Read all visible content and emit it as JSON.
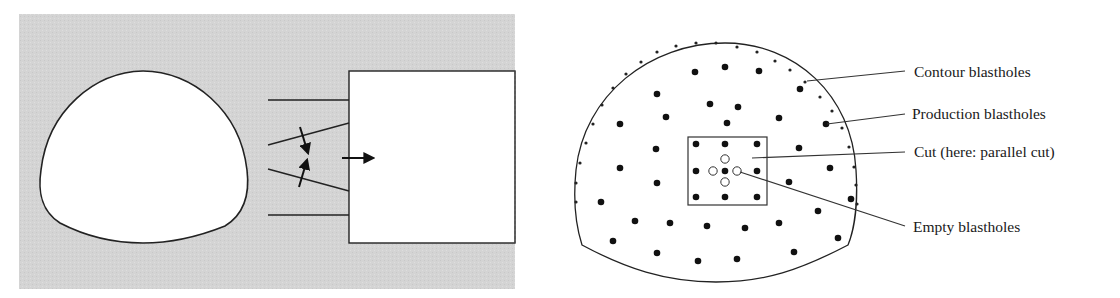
{
  "left_panel": {
    "background_color": "#d6d6d6",
    "rock_mass": "gray-shaded",
    "tunnel_profile": "excavated cross-section (white)",
    "drilled_round": "longitudinal section with blastholes and advance arrow"
  },
  "right_panel": {
    "labels": {
      "contour": "Contour blastholes",
      "production": "Production blastholes",
      "cut": "Cut (here: parallel cut)",
      "empty": "Empty blastholes"
    },
    "production_hole_count": 40,
    "cut_loaded_hole_count": 9,
    "empty_hole_count": 4
  },
  "colors": {
    "line": "#222222",
    "fill": "#ffffff",
    "gray": "#d6d6d6"
  }
}
